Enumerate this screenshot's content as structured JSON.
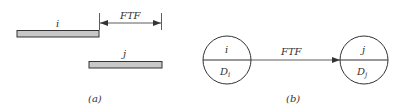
{
  "panel_a": {
    "bar_i_label": "i",
    "bar_j_label": "j",
    "lag_label": "FTF",
    "caption": "(a)",
    "bar_fill": "#c8c8c8",
    "stroke": "#333333"
  },
  "panel_b": {
    "node_i_top": "i",
    "node_i_bottom": "D",
    "node_i_sub": "i",
    "node_j_top": "j",
    "node_j_bottom": "D",
    "node_j_sub": "j",
    "link_label": "FTF",
    "caption": "(b)"
  }
}
